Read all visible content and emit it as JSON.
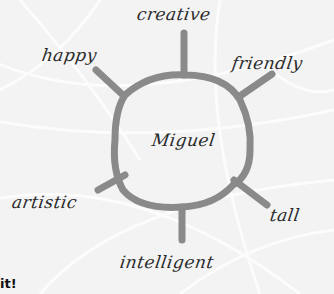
{
  "diagram": {
    "type": "word-web",
    "center": {
      "label": "Miguel"
    },
    "spokes": [
      {
        "label": "creative",
        "position": "top"
      },
      {
        "label": "friendly",
        "position": "top-right"
      },
      {
        "label": "tall",
        "position": "bottom-right"
      },
      {
        "label": "intelligent",
        "position": "bottom"
      },
      {
        "label": "artistic",
        "position": "bottom-left"
      },
      {
        "label": "happy",
        "position": "top-left"
      }
    ],
    "line_color": "#8a8a8a",
    "background_color": "#f3f3f3"
  },
  "footer": {
    "text": "it!"
  }
}
